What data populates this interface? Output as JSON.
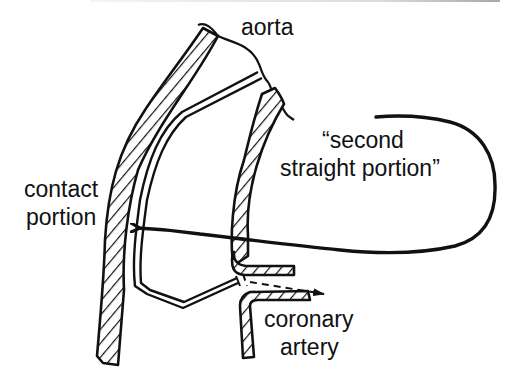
{
  "figure": {
    "type": "schematic",
    "colors": {
      "ink": "#111111",
      "background": "#ffffff"
    }
  },
  "labels": {
    "aorta": "aorta",
    "second_straight_line1": "“second",
    "second_straight_line2": "straight portion”",
    "contact_line1": "contact",
    "contact_line2": "portion",
    "coronary_line1": "coronary",
    "coronary_line2": "artery"
  },
  "annotations": [
    {
      "label": "aorta",
      "points_to": "aortic root (top)"
    },
    {
      "label": "second straight portion",
      "points_to": "catheter segment along left wall",
      "connector": "looped arrow"
    },
    {
      "label": "contact portion",
      "points_to": "catheter touching left aortic wall"
    },
    {
      "label": "coronary artery",
      "points_to": "coronary ostium with dashed flow arrow"
    }
  ]
}
